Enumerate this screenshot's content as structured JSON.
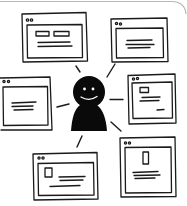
{
  "illustration": {
    "title": "Person surrounded by browser windows",
    "stroke_color": "#1a1a1a",
    "frame_color": "#b8b8b8",
    "background": "#ffffff",
    "person": {
      "description": "smiling person silhouette",
      "fill": "#0a0a0a",
      "face_color": "#ffffff"
    },
    "windows": [
      {
        "id": "top-left",
        "content": "two-buttons-and-text"
      },
      {
        "id": "top-right",
        "content": "text-lines"
      },
      {
        "id": "left",
        "content": "text-lines"
      },
      {
        "id": "right",
        "content": "image-text-and-caption"
      },
      {
        "id": "bottom-right",
        "content": "tall-image-and-text"
      },
      {
        "id": "bottom-left",
        "content": "image-and-text"
      }
    ],
    "rays_count": 6
  }
}
